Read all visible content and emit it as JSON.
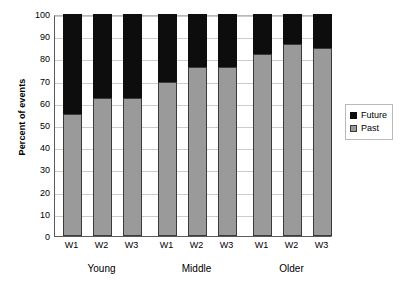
{
  "chart_data": {
    "type": "bar",
    "subtype": "stacked-100-percent",
    "title": "",
    "xlabel": "",
    "ylabel": "Percent of events",
    "ylim": [
      0,
      100
    ],
    "ytick_step": 10,
    "yticks": [
      100,
      90,
      80,
      70,
      60,
      50,
      40,
      30,
      20,
      10,
      0
    ],
    "grid": true,
    "grid_axis": "y",
    "legend_position": "right",
    "groups": [
      "Young",
      "Middle",
      "Older"
    ],
    "categories": [
      "W1",
      "W2",
      "W3",
      "W1",
      "W2",
      "W3",
      "W1",
      "W2",
      "W3"
    ],
    "series": [
      {
        "name": "Past",
        "color": "#9a9a9a",
        "values": [
          55,
          62,
          62,
          69.5,
          76,
          76,
          82,
          86.5,
          84.5
        ]
      },
      {
        "name": "Future",
        "color": "#0d0d0d",
        "values": [
          45,
          38,
          38,
          30.5,
          24,
          24,
          18,
          13.5,
          15.5
        ]
      }
    ],
    "bars": [
      {
        "group": "Young",
        "wave": "W1",
        "past": 55,
        "future": 45
      },
      {
        "group": "Young",
        "wave": "W2",
        "past": 62,
        "future": 38
      },
      {
        "group": "Young",
        "wave": "W3",
        "past": 62,
        "future": 38
      },
      {
        "group": "Middle",
        "wave": "W1",
        "past": 69.5,
        "future": 30.5
      },
      {
        "group": "Middle",
        "wave": "W2",
        "past": 76,
        "future": 24
      },
      {
        "group": "Middle",
        "wave": "W3",
        "past": 76,
        "future": 24
      },
      {
        "group": "Older",
        "wave": "W1",
        "past": 82,
        "future": 18
      },
      {
        "group": "Older",
        "wave": "W2",
        "past": 86.5,
        "future": 13.5
      },
      {
        "group": "Older",
        "wave": "W3",
        "past": 84.5,
        "future": 15.5
      }
    ],
    "legend": [
      {
        "label": "Future",
        "color": "#0d0d0d"
      },
      {
        "label": "Past",
        "color": "#9a9a9a"
      }
    ]
  },
  "axis": {
    "y_title": "Percent of events",
    "y_ticks": [
      "100",
      "90",
      "80",
      "70",
      "60",
      "50",
      "40",
      "30",
      "20",
      "10",
      "0"
    ],
    "x_ticks": [
      "W1",
      "W2",
      "W3",
      "W1",
      "W2",
      "W3",
      "W1",
      "W2",
      "W3"
    ],
    "group_labels": [
      "Young",
      "Middle",
      "Older"
    ]
  },
  "legend": {
    "items": [
      {
        "label": "Future"
      },
      {
        "label": "Past"
      }
    ]
  },
  "colors": {
    "past": "#9a9a9a",
    "future": "#0d0d0d",
    "grid": "#cccccc",
    "axis": "#5a5a5a",
    "background": "#ffffff"
  }
}
